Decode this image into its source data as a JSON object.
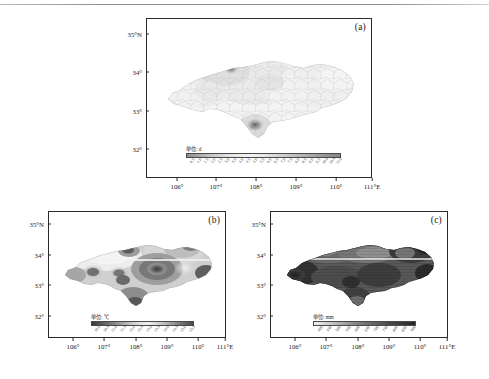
{
  "figure": {
    "panel_count": 3,
    "region_extent": {
      "lon_min": 105.5,
      "lon_max": 111.0,
      "lat_min": 31.5,
      "lat_max": 35.0
    }
  },
  "panels": [
    {
      "tag": "(a)",
      "unit_label": "单位: d",
      "yticks": [
        "35°N",
        "34°",
        "33°",
        "32°"
      ],
      "ytick_values": [
        35,
        34,
        33,
        32
      ],
      "xticks": [
        "106°",
        "107°",
        "108°",
        "109°",
        "110°",
        "111°E"
      ],
      "xtick_values": [
        106,
        107,
        108,
        109,
        110,
        111
      ],
      "cbar_ticks": [
        "0.5",
        "1.0",
        "1.5",
        "2.0",
        "2.5",
        "3.0",
        "3.5",
        "4.0",
        "4.5",
        "5.0",
        "5.5",
        "6.0",
        "6.5",
        "7.0",
        "7.5",
        "8.0",
        "8.5",
        "9.0",
        "9.5",
        "10.0",
        "10.5",
        "11.0"
      ]
    },
    {
      "tag": "(b)",
      "unit_label": "单位: ℃",
      "yticks": [
        "35°N",
        "34°",
        "33°",
        "32°"
      ],
      "ytick_values": [
        35,
        34,
        33,
        32
      ],
      "xticks": [
        "106°",
        "107°",
        "108°",
        "109°",
        "110°",
        "111°E"
      ],
      "xtick_values": [
        106,
        107,
        108,
        109,
        110,
        111
      ],
      "cbar_ticks": [
        "10.0",
        "10.5",
        "11.0",
        "11.5",
        "12.0",
        "12.5",
        "13.0",
        "13.5",
        "14.0",
        "14.5",
        "15.0",
        "15.5"
      ]
    },
    {
      "tag": "(c)",
      "unit_label": "单位: mm",
      "yticks": [
        "35°N",
        "34°",
        "33°",
        "32°"
      ],
      "ytick_values": [
        35,
        34,
        33,
        32
      ],
      "xticks": [
        "106°",
        "107°",
        "108°",
        "109°",
        "110°",
        "111°E"
      ],
      "xtick_values": [
        106,
        107,
        108,
        109,
        110,
        111
      ],
      "cbar_ticks": [
        "400",
        "450",
        "500",
        "550",
        "600",
        "650",
        "700",
        "750",
        "800",
        "850",
        "900"
      ]
    }
  ],
  "chart_data": {
    "type": "heatmap",
    "title": "",
    "xlabel": "Longitude",
    "ylabel": "Latitude",
    "grid": false,
    "legend": "colorbar below each map",
    "maps": [
      {
        "panel": "(a)",
        "unit": "d",
        "colormap": "grayscale",
        "vmin": 0.5,
        "vmax": 11.0,
        "description": "Light overall field with small dark maxima in north-central and south-central areas",
        "features": [
          {
            "name": "north-central maximum",
            "lon": 107.6,
            "lat": 34.15,
            "value": 9.5
          },
          {
            "name": "south-central maximum",
            "lon": 108.6,
            "lat": 32.95,
            "value": 10.5
          },
          {
            "name": "western low",
            "lon": 106.3,
            "lat": 33.4,
            "value": 1.5
          },
          {
            "name": "eastern low",
            "lon": 110.2,
            "lat": 33.8,
            "value": 2.0
          }
        ]
      },
      {
        "panel": "(b)",
        "unit": "℃",
        "colormap": "grayscale",
        "vmin": 10.0,
        "vmax": 15.5,
        "description": "Banded contour field with concentric cool centers in west and a strong warm core near 109°E, 33.7°N",
        "features": [
          {
            "name": "central warm core",
            "lon": 109.0,
            "lat": 33.7,
            "value": 15.0
          },
          {
            "name": "west cool center",
            "lon": 107.2,
            "lat": 33.6,
            "value": 11.5
          },
          {
            "name": "mid cool center",
            "lon": 107.9,
            "lat": 33.6,
            "value": 11.5
          },
          {
            "name": "northwest light band",
            "lon": 107.0,
            "lat": 34.3,
            "value": 10.5
          },
          {
            "name": "eastern warm edge",
            "lon": 110.8,
            "lat": 33.6,
            "value": 15.0
          }
        ]
      },
      {
        "panel": "(c)",
        "unit": "mm",
        "colormap": "grayscale-inverted",
        "vmin": 400,
        "vmax": 900,
        "description": "Dark (high) field overall with light low-precipitation pockets near 107.2°E 34.1°N and along the 34° band",
        "features": [
          {
            "name": "northwest dry pocket",
            "lon": 107.2,
            "lat": 34.1,
            "value": 450
          },
          {
            "name": "central dry band",
            "lon": 108.4,
            "lat": 34.0,
            "value": 500
          },
          {
            "name": "eastern dry pocket",
            "lon": 110.3,
            "lat": 34.1,
            "value": 500
          },
          {
            "name": "southwest wet area",
            "lon": 106.2,
            "lat": 33.4,
            "value": 850
          },
          {
            "name": "south wet area",
            "lon": 108.7,
            "lat": 32.8,
            "value": 800
          }
        ]
      }
    ]
  }
}
